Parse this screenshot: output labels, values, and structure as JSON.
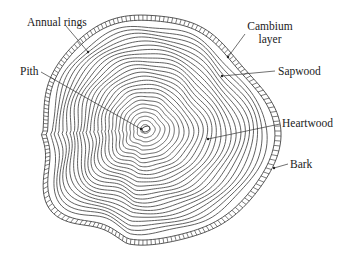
{
  "diagram": {
    "colors": {
      "background": "#ffffff",
      "line": "#444444",
      "text": "#222222"
    },
    "center": {
      "x": 145,
      "y": 131
    },
    "ring_count": 26,
    "labels": [
      {
        "id": "annual-rings",
        "lines": [
          "Annual rings"
        ],
        "x": 27,
        "y": 26,
        "anchor": "start",
        "leader": [
          [
            66,
            26
          ],
          [
            88,
            52
          ]
        ]
      },
      {
        "id": "pith",
        "lines": [
          "Pith"
        ],
        "x": 20,
        "y": 75,
        "anchor": "start",
        "leader": [
          [
            41,
            72
          ],
          [
            141,
            129
          ]
        ]
      },
      {
        "id": "cambium-layer",
        "lines": [
          "Cambium",
          "layer"
        ],
        "x": 270,
        "y": 30,
        "anchor": "middle",
        "leader": [
          [
            245,
            34
          ],
          [
            228,
            57
          ]
        ]
      },
      {
        "id": "sapwood",
        "lines": [
          "Sapwood"
        ],
        "x": 278,
        "y": 75,
        "anchor": "start",
        "leader": [
          [
            275,
            71
          ],
          [
            222,
            76
          ]
        ]
      },
      {
        "id": "heartwood",
        "lines": [
          "Heartwood"
        ],
        "x": 282,
        "y": 127,
        "anchor": "start",
        "leader": [
          [
            280,
            124
          ],
          [
            208,
            139
          ]
        ]
      },
      {
        "id": "bark",
        "lines": [
          "Bark"
        ],
        "x": 290,
        "y": 168,
        "anchor": "start",
        "leader": [
          [
            288,
            164
          ],
          [
            274,
            168
          ]
        ]
      }
    ]
  }
}
